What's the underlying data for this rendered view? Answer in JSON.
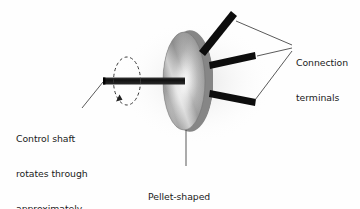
{
  "figure": {
    "background_color": "#fefefe",
    "ink_color": "#1a1a1a"
  },
  "labels": {
    "control_shaft": {
      "name": "control-shaft-label",
      "lines": [
        "Control shaft",
        "rotates through",
        "approximately",
        "270 degrees"
      ],
      "text": "Control shaft rotates through approximately 270 degrees"
    },
    "connection_terminals": {
      "name": "connection-terminals-label",
      "lines": [
        "Connection",
        "terminals"
      ],
      "text": "Connection terminals"
    },
    "pellet_housing": {
      "name": "pellet-housing-label",
      "lines": [
        "Pellet-shaped",
        "housing"
      ],
      "text": "Pellet-shaped housing"
    }
  },
  "parts": {
    "housing": {
      "name": "pellet-shaped-housing",
      "description": "Cylindrical pellet body drawn in perspective",
      "body_color": "#8e8e8e",
      "rim_color": "#6f6f6f",
      "face_highlight_color": "#f5f5f5",
      "face_shadow_color": "#6a6a6a"
    },
    "shaft": {
      "name": "control-shaft",
      "description": "Horizontal control shaft protruding from the front face",
      "color": "#141414",
      "rotation_degrees": "270"
    },
    "rotation_indicator": {
      "name": "rotation-arrow-indicator",
      "description": "Dashed ellipse with arrowhead showing shaft rotation",
      "color": "#3a3a3a",
      "style": "dashed"
    },
    "terminals": [
      {
        "name": "connection-terminal-upper",
        "color": "#0d0d0d"
      },
      {
        "name": "connection-terminal-middle",
        "color": "#0d0d0d"
      },
      {
        "name": "connection-terminal-lower",
        "color": "#0d0d0d"
      }
    ],
    "leader_lines": {
      "name": "leader-lines",
      "color": "#3c3c3c",
      "count": "5"
    }
  }
}
